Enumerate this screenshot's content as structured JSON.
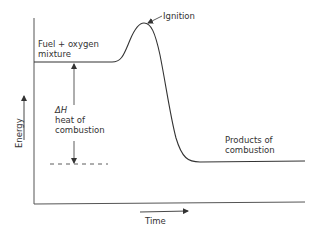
{
  "diagram": {
    "type": "energy-profile",
    "axes": {
      "y_label": "Energy",
      "x_label": "Time"
    },
    "labels": {
      "reactants_line1": "Fuel + oxygen",
      "reactants_line2": "mixture",
      "peak": "Ignition",
      "delta_symbol": "ΔH",
      "delta_line2": "heat of",
      "delta_line3": "combustion",
      "products_line1": "Products of",
      "products_line2": "combustion"
    },
    "colors": {
      "line": "#333333",
      "background": "#ffffff"
    }
  }
}
